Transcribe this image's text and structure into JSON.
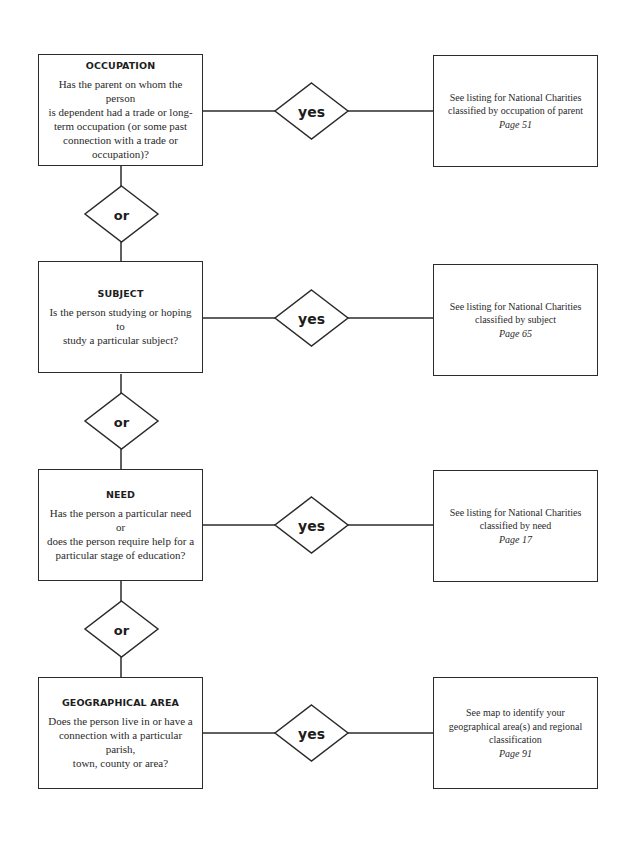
{
  "diagram": {
    "type": "flowchart",
    "rows": [
      {
        "question": {
          "title": "OCCUPATION",
          "lines": [
            "Has the parent on whom the person",
            "is dependent had a trade or long-",
            "term occupation (or some past",
            "connection with a trade or",
            "occupation)?"
          ]
        },
        "decision_label": "yes",
        "result": {
          "lines": [
            "See listing for National Charities",
            "classified by occupation of parent"
          ],
          "page": "Page 51"
        }
      },
      {
        "question": {
          "title": "SUBJECT",
          "lines": [
            "Is the person studying or hoping to",
            "study a particular subject?"
          ]
        },
        "decision_label": "yes",
        "result": {
          "lines": [
            "See listing for National Charities",
            "classified by subject"
          ],
          "page": "Page 65"
        }
      },
      {
        "question": {
          "title": "NEED",
          "lines": [
            "Has the person a particular need or",
            "does the person require help for a",
            "particular stage of education?"
          ]
        },
        "decision_label": "yes",
        "result": {
          "lines": [
            "See listing for National Charities",
            "classified by need"
          ],
          "page": "Page 17"
        }
      },
      {
        "question": {
          "title": "GEOGRAPHICAL AREA",
          "lines": [
            "Does the person live in or have a",
            "connection with a particular parish,",
            "town, county or area?"
          ]
        },
        "decision_label": "yes",
        "result": {
          "lines": [
            "See map to identify your",
            "geographical area(s) and regional",
            "classification"
          ],
          "page": "Page 91"
        }
      }
    ],
    "connectors": [
      "or",
      "or",
      "or"
    ],
    "colors": {
      "line": "#2b2b2b",
      "background": "#ffffff",
      "text": "#222222"
    }
  }
}
